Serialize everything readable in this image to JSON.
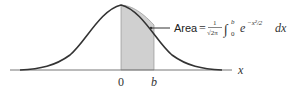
{
  "diagram": {
    "type": "normal-distribution-area",
    "axis_label": "x",
    "tick_labels": [
      "0",
      "b"
    ],
    "annotation": {
      "area_word": "Area",
      "equals": "=",
      "frac_num": "1",
      "frac_den": "√2π",
      "integral": "∫",
      "upper": "b",
      "lower": "0",
      "integrand": "e",
      "exponent": "−x²/2",
      "differential": "dx"
    },
    "colors": {
      "curve": "#333333",
      "shade": "#d0d0d0",
      "axis": "#555555"
    }
  }
}
